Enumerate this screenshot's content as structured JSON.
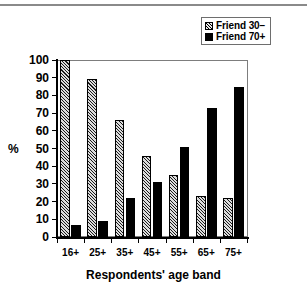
{
  "chart_data": {
    "type": "bar",
    "title": "",
    "subtitle": "",
    "xlabel": "Respondents' age band",
    "ylabel": "%",
    "ylim": [
      0,
      100
    ],
    "ytick_step": 10,
    "yticks": [
      "0",
      "10",
      "20",
      "30",
      "40",
      "50",
      "60",
      "70",
      "80",
      "90",
      "100"
    ],
    "grid": false,
    "legend_position": "top-right",
    "categories": [
      "16+",
      "25+",
      "35+",
      "45+",
      "55+",
      "65+",
      "75+"
    ],
    "series": [
      {
        "name": "Friend 30−",
        "swatch": "hatched",
        "color": "#dcdcdc",
        "values": [
          100,
          89,
          66,
          46,
          35,
          23,
          22
        ]
      },
      {
        "name": "Friend 70+",
        "swatch": "solid",
        "color": "#000000",
        "values": [
          7,
          9,
          22,
          31,
          51,
          73,
          85
        ]
      }
    ]
  },
  "legend": {
    "items": [
      {
        "label": "Friend 30−",
        "swatch": "hatched"
      },
      {
        "label": "Friend 70+",
        "swatch": "solid"
      }
    ]
  },
  "axes": {
    "y_title": "%",
    "x_title": "Respondents' age band"
  }
}
